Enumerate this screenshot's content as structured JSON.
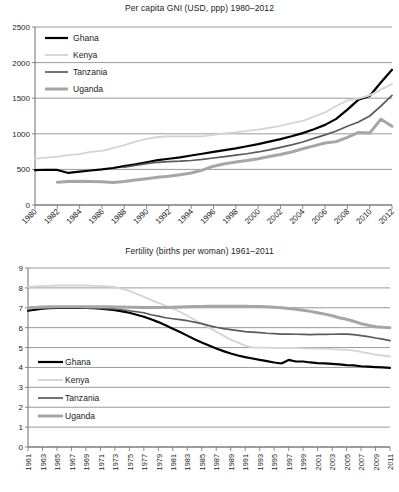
{
  "charts": {
    "gni": {
      "title": "Per capita GNI (USD, ppp) 1980–2012",
      "legend": [
        {
          "name": "Ghana",
          "color": "#000000",
          "width": 2.2
        },
        {
          "name": "Kenya",
          "color": "#d4d4d4",
          "width": 1.8
        },
        {
          "name": "Tanzania",
          "color": "#5a5a5a",
          "width": 1.7
        },
        {
          "name": "Uganda",
          "color": "#a6a6a6",
          "width": 3.0
        }
      ]
    },
    "fertility": {
      "title": "Fertility (births per woman) 1961–2011",
      "legend": [
        {
          "name": "Ghana",
          "color": "#000000",
          "width": 2.2
        },
        {
          "name": "Kenya",
          "color": "#d4d4d4",
          "width": 1.8
        },
        {
          "name": "Tanzania",
          "color": "#5a5a5a",
          "width": 1.7
        },
        {
          "name": "Uganda",
          "color": "#a6a6a6",
          "width": 3.0
        }
      ]
    }
  },
  "chart_data": [
    {
      "id": "gni",
      "type": "line",
      "title": "Per capita GNI (USD, ppp) 1980–2012",
      "xlabel": "",
      "ylabel": "",
      "xlim": [
        1980,
        2012
      ],
      "ylim": [
        0,
        2500
      ],
      "yticks": [
        0,
        500,
        1000,
        1500,
        2000,
        2500
      ],
      "xticks": [
        1980,
        1982,
        1984,
        1986,
        1988,
        1990,
        1992,
        1994,
        1996,
        1998,
        2000,
        2002,
        2004,
        2006,
        2008,
        2010,
        2012
      ],
      "xtick_labels": [
        "1980",
        "1982",
        "1984",
        "1986",
        "1988",
        "1990",
        "1992",
        "1994",
        "1996",
        "1998",
        "2000",
        "2002",
        "2004",
        "2006",
        "2008",
        "2010",
        "2012"
      ],
      "xtick_rotation": -45,
      "grid": true,
      "legend_position": "upper left",
      "x": [
        1980,
        1981,
        1982,
        1983,
        1984,
        1985,
        1986,
        1987,
        1988,
        1989,
        1990,
        1991,
        1992,
        1993,
        1994,
        1995,
        1996,
        1997,
        1998,
        1999,
        2000,
        2001,
        2002,
        2003,
        2004,
        2005,
        2006,
        2007,
        2008,
        2009,
        2010,
        2011,
        2012
      ],
      "series": [
        {
          "name": "Ghana",
          "color": "#000000",
          "values": [
            490,
            495,
            492,
            450,
            470,
            485,
            500,
            520,
            545,
            570,
            600,
            630,
            650,
            670,
            695,
            720,
            745,
            770,
            795,
            825,
            855,
            890,
            925,
            965,
            1010,
            1065,
            1125,
            1210,
            1340,
            1480,
            1530,
            1720,
            1900
          ]
        },
        {
          "name": "Kenya",
          "color": "#d4d4d4",
          "values": [
            650,
            665,
            680,
            700,
            715,
            745,
            760,
            800,
            840,
            890,
            930,
            955,
            965,
            965,
            965,
            965,
            985,
            1005,
            1020,
            1040,
            1060,
            1085,
            1110,
            1150,
            1180,
            1240,
            1300,
            1390,
            1470,
            1495,
            1540,
            1620,
            1700
          ]
        },
        {
          "name": "Tanzania",
          "color": "#5a5a5a",
          "values": [
            null,
            null,
            null,
            null,
            null,
            null,
            null,
            null,
            530,
            555,
            580,
            600,
            610,
            615,
            625,
            640,
            660,
            680,
            700,
            720,
            745,
            775,
            810,
            845,
            885,
            935,
            985,
            1040,
            1105,
            1165,
            1250,
            1390,
            1540
          ]
        },
        {
          "name": "Uganda",
          "color": "#a6a6a6",
          "values": [
            null,
            null,
            320,
            330,
            335,
            330,
            325,
            315,
            330,
            350,
            370,
            390,
            405,
            425,
            450,
            490,
            545,
            580,
            605,
            625,
            650,
            680,
            710,
            745,
            790,
            830,
            870,
            890,
            950,
            1020,
            1010,
            1205,
            1105
          ]
        }
      ]
    },
    {
      "id": "fertility",
      "type": "line",
      "title": "Fertility (births per woman) 1961–2011",
      "xlabel": "",
      "ylabel": "",
      "xlim": [
        1961,
        2011
      ],
      "ylim": [
        0,
        9
      ],
      "yticks": [
        0,
        1,
        2,
        3,
        4,
        5,
        6,
        7,
        8,
        9
      ],
      "xticks": [
        1961,
        1963,
        1965,
        1967,
        1969,
        1971,
        1973,
        1975,
        1977,
        1979,
        1981,
        1983,
        1985,
        1987,
        1989,
        1991,
        1993,
        1995,
        1997,
        1999,
        2001,
        2003,
        2005,
        2007,
        2009,
        2011
      ],
      "xtick_labels": [
        "1961",
        "1963",
        "1965",
        "1967",
        "1969",
        "1971",
        "1973",
        "1975",
        "1977",
        "1979",
        "1981",
        "1983",
        "1985",
        "1987",
        "1989",
        "1991",
        "1993",
        "1995",
        "1997",
        "1999",
        "2001",
        "2003",
        "2005",
        "2007",
        "2009",
        "2011"
      ],
      "xtick_rotation": -90,
      "grid": true,
      "legend_position": "lower left",
      "x": [
        1961,
        1962,
        1963,
        1964,
        1965,
        1966,
        1967,
        1968,
        1969,
        1970,
        1971,
        1972,
        1973,
        1974,
        1975,
        1976,
        1977,
        1978,
        1979,
        1980,
        1981,
        1982,
        1983,
        1984,
        1985,
        1986,
        1987,
        1988,
        1989,
        1990,
        1991,
        1992,
        1993,
        1994,
        1995,
        1996,
        1997,
        1998,
        1999,
        2000,
        2001,
        2002,
        2003,
        2004,
        2005,
        2006,
        2007,
        2008,
        2009,
        2010,
        2011
      ],
      "series": [
        {
          "name": "Ghana",
          "color": "#000000",
          "values": [
            6.85,
            6.9,
            6.95,
            6.98,
            7.0,
            7.0,
            7.0,
            7.0,
            7.0,
            6.98,
            6.95,
            6.92,
            6.88,
            6.82,
            6.75,
            6.65,
            6.55,
            6.42,
            6.28,
            6.12,
            5.95,
            5.78,
            5.6,
            5.42,
            5.25,
            5.1,
            4.95,
            4.82,
            4.7,
            4.6,
            4.52,
            4.45,
            4.38,
            4.32,
            4.25,
            4.2,
            4.38,
            4.3,
            4.3,
            4.25,
            4.22,
            4.2,
            4.18,
            4.15,
            4.12,
            4.1,
            4.06,
            4.04,
            4.02,
            4.0,
            3.98
          ]
        },
        {
          "name": "Kenya",
          "color": "#d4d4d4",
          "values": [
            8.05,
            8.08,
            8.1,
            8.1,
            8.12,
            8.12,
            8.13,
            8.12,
            8.12,
            8.1,
            8.1,
            8.08,
            8.05,
            7.95,
            7.85,
            7.7,
            7.55,
            7.4,
            7.25,
            7.1,
            6.95,
            6.8,
            6.6,
            6.4,
            6.2,
            6.0,
            5.8,
            5.6,
            5.4,
            5.25,
            5.1,
            5.0,
            5.0,
            5.0,
            4.98,
            4.98,
            4.98,
            4.98,
            4.96,
            4.96,
            4.95,
            4.95,
            4.92,
            4.9,
            4.88,
            4.85,
            4.78,
            4.72,
            4.65,
            4.6,
            4.55
          ]
        },
        {
          "name": "Tanzania",
          "color": "#5a5a5a",
          "values": [
            6.95,
            6.98,
            7.0,
            7.0,
            7.02,
            7.02,
            7.02,
            7.02,
            7.0,
            7.0,
            6.98,
            6.96,
            6.94,
            6.9,
            6.85,
            6.8,
            6.75,
            6.65,
            6.58,
            6.5,
            6.45,
            6.4,
            6.35,
            6.28,
            6.2,
            6.1,
            6.02,
            5.95,
            5.9,
            5.85,
            5.8,
            5.78,
            5.75,
            5.72,
            5.7,
            5.68,
            5.68,
            5.67,
            5.66,
            5.65,
            5.66,
            5.66,
            5.67,
            5.68,
            5.68,
            5.65,
            5.6,
            5.55,
            5.48,
            5.42,
            5.35
          ]
        },
        {
          "name": "Uganda",
          "color": "#a6a6a6",
          "values": [
            7.0,
            7.02,
            7.04,
            7.05,
            7.05,
            7.05,
            7.05,
            7.05,
            7.05,
            7.05,
            7.05,
            7.05,
            7.04,
            7.04,
            7.03,
            7.03,
            7.02,
            7.02,
            7.02,
            7.02,
            7.03,
            7.04,
            7.05,
            7.06,
            7.07,
            7.08,
            7.08,
            7.08,
            7.08,
            7.08,
            7.08,
            7.07,
            7.06,
            7.05,
            7.03,
            7.0,
            6.96,
            6.92,
            6.88,
            6.82,
            6.75,
            6.68,
            6.6,
            6.5,
            6.42,
            6.32,
            6.2,
            6.12,
            6.05,
            6.02,
            6.0
          ]
        }
      ]
    }
  ]
}
